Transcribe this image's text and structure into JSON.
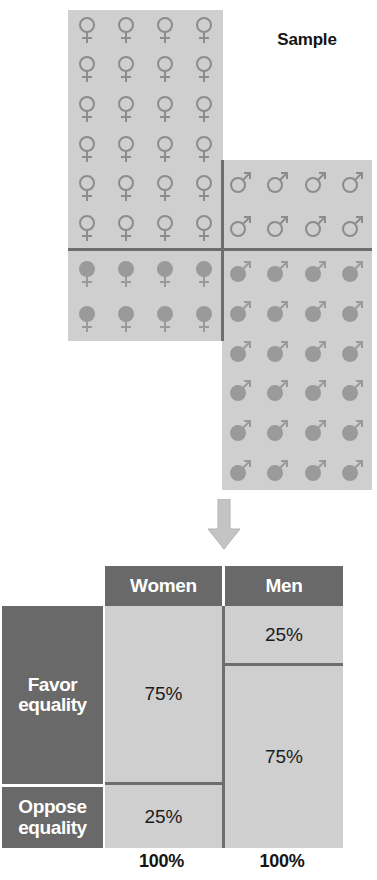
{
  "figure": {
    "sample_label": "Sample",
    "colors": {
      "panel_fill": "#cfcfcf",
      "panel_divider": "#6e6e6e",
      "glyph_outline": "#8c8c8c",
      "glyph_filled": "#9a9a9a",
      "table_header_bg": "#696969",
      "table_header_text": "#ffffff",
      "table_cell_bg": "#cfcfcf",
      "table_cell_text": "#1c1c1c",
      "arrow_fill": "#c4c4c4"
    }
  },
  "pictogram": {
    "women": {
      "icon": "venus-symbol",
      "columns": 4,
      "outline_rows": 6,
      "outline_count": 24,
      "filled_rows": 2,
      "filled_count": 8,
      "total": 32
    },
    "men": {
      "icon": "mars-symbol",
      "columns": 4,
      "outline_rows": 2,
      "outline_count": 8,
      "filled_rows": 6,
      "filled_count": 24,
      "total": 32
    }
  },
  "table": {
    "column_headers": [
      "Women",
      "Men"
    ],
    "row_labels": [
      {
        "line1": "Favor",
        "line2": "equality"
      },
      {
        "line1": "Oppose",
        "line2": "equality"
      }
    ],
    "cells": {
      "women_favor": "75%",
      "women_oppose": "25%",
      "men_favor_top": "25%",
      "men_favor_bottom": "75%"
    },
    "totals": [
      "100%",
      "100%"
    ]
  },
  "chart_data": {
    "type": "bar",
    "title": "Sample",
    "categories": [
      "Women",
      "Men"
    ],
    "series": [
      {
        "name": "Favor equality",
        "values": [
          75,
          75
        ]
      },
      {
        "name": "Oppose equality",
        "values": [
          25,
          25
        ]
      }
    ],
    "cell_labels": {
      "Women": {
        "Favor equality": "75%",
        "Oppose equality": "25%"
      },
      "Men": {
        "Favor equality": "75%",
        "Oppose equality": "25%"
      }
    },
    "extra_men_segment_label": "25%",
    "column_totals": [
      "100%",
      "100%"
    ],
    "xlabel": "",
    "ylabel": "",
    "ylim": [
      0,
      100
    ],
    "grid": false,
    "legend": "none"
  }
}
